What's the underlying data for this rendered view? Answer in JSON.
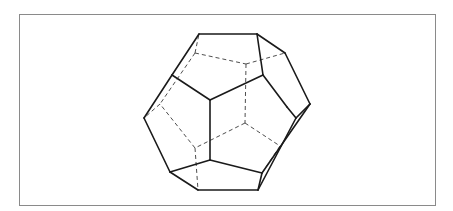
{
  "figure": {
    "title": "Dodecahedron (wireframe with hidden edges)",
    "subject": "dodecahedron",
    "frame": {
      "x": 19,
      "y": 14,
      "width": 417,
      "height": 192,
      "border_color": "#8a8a8a"
    },
    "colors": {
      "background": "#ffffff",
      "solid_edge": "#1a1a1a",
      "hidden_edge": "#3a3a3a"
    },
    "visible_vertices": {
      "A": [
        199,
        34
      ],
      "B": [
        257,
        34
      ],
      "C": [
        285,
        53
      ],
      "D": [
        310,
        104
      ],
      "E": [
        296,
        118
      ],
      "F": [
        258,
        190
      ],
      "G": [
        198,
        190
      ],
      "H": [
        170,
        172
      ],
      "I": [
        144,
        118
      ],
      "J": [
        172,
        75
      ],
      "K": [
        210,
        100
      ],
      "L": [
        263,
        75
      ],
      "M": [
        210,
        160
      ],
      "N": [
        262,
        173
      ],
      "W": [
        287,
        107
      ]
    },
    "hidden_vertices": {
      "P": [
        195,
        53
      ],
      "Q": [
        246,
        64
      ],
      "S": [
        160,
        104
      ],
      "T": [
        245,
        123
      ],
      "U": [
        195,
        148
      ],
      "V": [
        280,
        146
      ]
    },
    "solid_edges": [
      [
        "A",
        "B"
      ],
      [
        "B",
        "C"
      ],
      [
        "C",
        "D"
      ],
      [
        "D",
        "E"
      ],
      [
        "E",
        "F"
      ],
      [
        "F",
        "G"
      ],
      [
        "G",
        "H"
      ],
      [
        "H",
        "I"
      ],
      [
        "I",
        "J"
      ],
      [
        "J",
        "A"
      ],
      [
        "B",
        "L"
      ],
      [
        "L",
        "K"
      ],
      [
        "K",
        "J"
      ],
      [
        "K",
        "M"
      ],
      [
        "M",
        "H"
      ],
      [
        "M",
        "N"
      ],
      [
        "N",
        "F"
      ],
      [
        "L",
        "W"
      ],
      [
        "W",
        "E"
      ],
      [
        "D",
        "N"
      ]
    ],
    "hidden_edges": [
      [
        "P",
        "Q"
      ],
      [
        "Q",
        "C"
      ],
      [
        "P",
        "A"
      ],
      [
        "P",
        "S"
      ],
      [
        "S",
        "I"
      ],
      [
        "Q",
        "T"
      ],
      [
        "T",
        "U"
      ],
      [
        "U",
        "S"
      ],
      [
        "U",
        "G"
      ],
      [
        "T",
        "V"
      ],
      [
        "V",
        "N"
      ]
    ]
  }
}
